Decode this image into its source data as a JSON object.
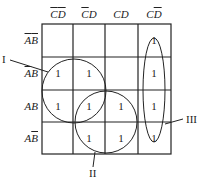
{
  "kmap": {
    "columns": [
      {
        "parts": [
          {
            "t": "C",
            "bar": true
          },
          {
            "t": "D",
            "bar": true
          }
        ]
      },
      {
        "parts": [
          {
            "t": "C",
            "bar": true
          },
          {
            "t": "D",
            "bar": false
          }
        ]
      },
      {
        "parts": [
          {
            "t": "C",
            "bar": false
          },
          {
            "t": "D",
            "bar": false
          }
        ]
      },
      {
        "parts": [
          {
            "t": "C",
            "bar": false
          },
          {
            "t": "D",
            "bar": true
          }
        ]
      }
    ],
    "rows": [
      {
        "parts": [
          {
            "t": "A",
            "bar": true
          },
          {
            "t": "B",
            "bar": true
          }
        ],
        "cells": [
          "",
          "",
          "",
          "1"
        ]
      },
      {
        "parts": [
          {
            "t": "A",
            "bar": true
          },
          {
            "t": "B",
            "bar": false
          }
        ],
        "cells": [
          "1",
          "1",
          "",
          "1"
        ]
      },
      {
        "parts": [
          {
            "t": "A",
            "bar": false
          },
          {
            "t": "B",
            "bar": false
          }
        ],
        "cells": [
          "1",
          "1",
          "1",
          "1"
        ]
      },
      {
        "parts": [
          {
            "t": "A",
            "bar": false
          },
          {
            "t": "B",
            "bar": true
          }
        ],
        "cells": [
          "",
          "1",
          "1",
          "1"
        ]
      }
    ]
  },
  "groups": {
    "g1": "I",
    "g2": "II",
    "g3": "III"
  }
}
